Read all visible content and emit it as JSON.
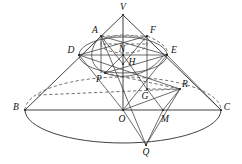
{
  "figure": {
    "kind": "geometry-diagram",
    "canvas": {
      "width": 242,
      "height": 164
    },
    "stroke_color": "#2b2b2b",
    "dash_color": "#4a4a4a",
    "background": "#ffffff",
    "labels": {
      "V": "V",
      "A": "A",
      "F": "F",
      "D": "D",
      "E": "E",
      "N": "N",
      "H": "H",
      "P": "P",
      "R": "R",
      "G": "G",
      "B": "B",
      "C": "C",
      "O": "O",
      "M": "M",
      "Q": "Q"
    },
    "label_positions": {
      "V": {
        "x": 123,
        "y": 8
      },
      "A": {
        "x": 95,
        "y": 31
      },
      "F": {
        "x": 153,
        "y": 31
      },
      "D": {
        "x": 71,
        "y": 51
      },
      "E": {
        "x": 173,
        "y": 51
      },
      "N": {
        "x": 122,
        "y": 50
      },
      "H": {
        "x": 131,
        "y": 63
      },
      "P": {
        "x": 99,
        "y": 79
      },
      "R": {
        "x": 184,
        "y": 85
      },
      "G": {
        "x": 145,
        "y": 97
      },
      "B": {
        "x": 16,
        "y": 108
      },
      "C": {
        "x": 226,
        "y": 108
      },
      "O": {
        "x": 123,
        "y": 120
      },
      "M": {
        "x": 164,
        "y": 120
      },
      "Q": {
        "x": 146,
        "y": 152
      }
    },
    "points": {
      "V": {
        "x": 123,
        "y": 15
      },
      "A": {
        "x": 101,
        "y": 36
      },
      "F": {
        "x": 147,
        "y": 36
      },
      "D": {
        "x": 79,
        "y": 55
      },
      "E": {
        "x": 167,
        "y": 55
      },
      "N": {
        "x": 123,
        "y": 55
      },
      "H": {
        "x": 123,
        "y": 64
      },
      "P": {
        "x": 105,
        "y": 73
      },
      "R": {
        "x": 180,
        "y": 89
      },
      "G": {
        "x": 147,
        "y": 89
      },
      "B": {
        "x": 25,
        "y": 110
      },
      "C": {
        "x": 221,
        "y": 110
      },
      "O": {
        "x": 123,
        "y": 110
      },
      "M": {
        "x": 163,
        "y": 110
      },
      "Q": {
        "x": 146,
        "y": 145
      }
    },
    "ellipses": {
      "base": {
        "cx": 123,
        "cy": 110,
        "rx": 98,
        "ry": 33
      },
      "mid_section": {
        "cx": 123,
        "cy": 55,
        "rx": 44,
        "ry": 18
      },
      "upper_section": {
        "cx": 124,
        "cy": 44,
        "rx": 23,
        "ry": 9
      }
    }
  }
}
